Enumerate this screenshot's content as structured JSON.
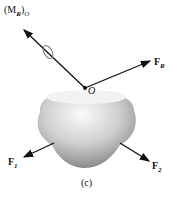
{
  "diagram": {
    "labels": {
      "moment": "(M",
      "moment_sub": "R",
      "moment_close": ")",
      "moment_sub2": "O",
      "origin": "O",
      "resultant": "F",
      "resultant_sub": "R",
      "f1": "F",
      "f1_sub": "1",
      "f2": "F",
      "f2_sub": "2",
      "caption": "(c)"
    },
    "colors": {
      "arrow": "#111111",
      "body_light": "#f4f4f4",
      "body_dark": "#8a8a8a"
    }
  }
}
